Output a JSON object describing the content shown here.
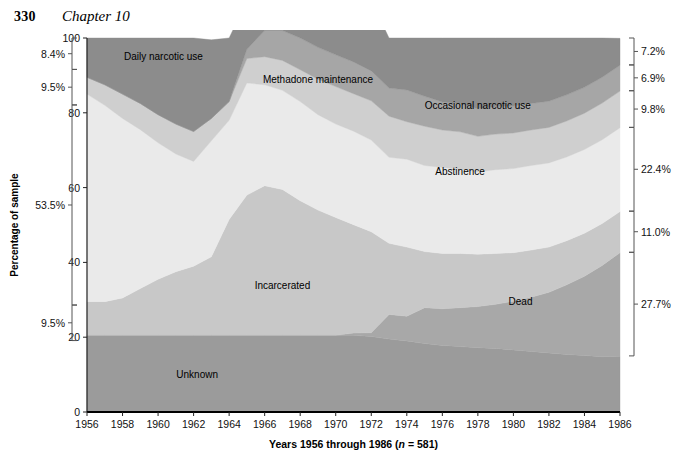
{
  "running_head": {
    "page_number": "330",
    "chapter": "Chapter 10"
  },
  "axes": {
    "y_title": "Percentage of sample",
    "y_ticks": [
      "0",
      "20",
      "40",
      "60",
      "80",
      "100"
    ],
    "y_tick_values": [
      0,
      20,
      40,
      60,
      80,
      100
    ],
    "x_title_main": "Years 1956 through 1986 (",
    "x_title_italic": "n",
    "x_title_tail": " = 581)",
    "x_title_full": "Years 1956 through 1986 (n = 581)",
    "x_ticks": [
      "1956",
      "1958",
      "1960",
      "1962",
      "1964",
      "1966",
      "1968",
      "1970",
      "1972",
      "1974",
      "1976",
      "1978",
      "1980",
      "1982",
      "1984",
      "1986"
    ],
    "left_percent_labels": [
      {
        "text": "8.4%",
        "from": 91.6,
        "to": 100.0
      },
      {
        "text": "9.5%",
        "from": 82.1,
        "to": 91.6
      },
      {
        "text": "53.5%",
        "from": 28.6,
        "to": 82.1
      },
      {
        "text": "9.5%",
        "from": 19.1,
        "to": 28.6
      }
    ],
    "right_percent_labels": [
      {
        "text": "7.2%",
        "from": 92.8,
        "to": 100.0
      },
      {
        "text": "6.9%",
        "from": 85.9,
        "to": 92.8
      },
      {
        "text": "9.8%",
        "from": 76.1,
        "to": 85.9
      },
      {
        "text": "22.4%",
        "from": 53.7,
        "to": 76.1
      },
      {
        "text": "11.0%",
        "from": 42.7,
        "to": 53.7
      },
      {
        "text": "27.7%",
        "from": 15.0,
        "to": 42.7
      }
    ]
  },
  "chart_data": {
    "type": "area",
    "title": "",
    "subtitle": "",
    "xlabel": "Years 1956 through 1986 (n = 581)",
    "ylabel": "Percentage of sample",
    "ylim": [
      0,
      100
    ],
    "xlim": [
      1956,
      1986
    ],
    "grid": false,
    "legend": "in-plot labels",
    "stacked": true,
    "x": [
      1956,
      1957,
      1958,
      1959,
      1960,
      1961,
      1962,
      1963,
      1964,
      1965,
      1966,
      1967,
      1968,
      1969,
      1970,
      1971,
      1972,
      1973,
      1974,
      1975,
      1976,
      1977,
      1978,
      1979,
      1980,
      1981,
      1982,
      1983,
      1984,
      1985,
      1986
    ],
    "series": [
      {
        "name": "Unknown",
        "color": "#9b9b9b",
        "label_x": 1962.2,
        "label_y": 9.0,
        "values": [
          20.5,
          20.5,
          20.5,
          20.5,
          20.5,
          20.5,
          20.5,
          20.5,
          20.5,
          20.5,
          20.5,
          20.5,
          20.5,
          20.5,
          20.5,
          20.5,
          20.2,
          19.5,
          19.0,
          18.3,
          17.8,
          17.5,
          17.2,
          17.0,
          16.6,
          16.2,
          15.8,
          15.4,
          15.1,
          14.8,
          14.9
        ]
      },
      {
        "name": "Dead",
        "color": "#a8a8a8",
        "label_x": 1980.4,
        "label_y": 28.5,
        "values": [
          0,
          0,
          0,
          0,
          0,
          0,
          0,
          0,
          0,
          0,
          0,
          0,
          0,
          0,
          0,
          0.6,
          1.0,
          6.6,
          6.6,
          9.6,
          9.8,
          10.4,
          11.0,
          11.8,
          13.0,
          14.5,
          16.2,
          18.6,
          21.2,
          24.4,
          27.7
        ]
      },
      {
        "name": "Incarcerated",
        "color": "#c8c8c8",
        "label_x": 1967.0,
        "label_y": 33.0,
        "values": [
          9.0,
          9.0,
          10.0,
          12.5,
          15.0,
          17.0,
          18.5,
          21.0,
          31.0,
          37.5,
          40.0,
          39.0,
          36.0,
          33.5,
          31.5,
          29.0,
          27.0,
          19.0,
          18.5,
          15.0,
          14.8,
          14.5,
          14.0,
          13.6,
          13.0,
          12.6,
          12.1,
          11.8,
          11.5,
          11.2,
          11.0
        ]
      },
      {
        "name": "Abstinence",
        "color": "#eaeaea",
        "label_x": 1977.0,
        "label_y": 63.5,
        "values": [
          55.5,
          52.5,
          48.0,
          42.5,
          36.5,
          31.5,
          28.0,
          31.0,
          26.5,
          30.0,
          27.0,
          26.5,
          26.5,
          25.5,
          25.0,
          25.0,
          24.5,
          23.0,
          23.5,
          23.0,
          23.0,
          22.5,
          22.0,
          22.4,
          22.5,
          22.6,
          22.5,
          22.4,
          22.4,
          22.4,
          22.4
        ]
      },
      {
        "name": "Occasional narcotic use",
        "color": "#cfcfcf",
        "label_x": 1978.0,
        "label_y": 81.0,
        "values": [
          4.5,
          5.5,
          6.5,
          7.0,
          7.5,
          8.0,
          8.0,
          6.0,
          5.0,
          6.5,
          7.5,
          8.0,
          8.5,
          9.5,
          10.0,
          10.0,
          10.5,
          11.0,
          10.0,
          10.5,
          10.0,
          10.0,
          9.5,
          9.5,
          9.5,
          9.5,
          9.5,
          9.6,
          9.7,
          9.8,
          9.8
        ]
      },
      {
        "name": "Methadone maintenance",
        "color": "#a6a6a6",
        "label_x": 1969.0,
        "label_y": 88.0,
        "values": [
          0,
          0,
          0,
          0,
          0,
          0,
          0,
          0,
          0,
          2.5,
          7.0,
          8.0,
          8.5,
          8.5,
          8.5,
          8.5,
          8.0,
          7.5,
          8.5,
          8.0,
          7.5,
          7.5,
          7.4,
          7.3,
          7.2,
          7.1,
          7.0,
          7.0,
          6.9,
          6.9,
          6.9
        ]
      },
      {
        "name": "Daily narcotic use",
        "color": "#8c8c8c",
        "label_x": 1960.3,
        "label_y": 94.0,
        "values": [
          10.5,
          12.5,
          15.0,
          17.5,
          20.5,
          23.0,
          25.0,
          21.0,
          17.0,
          13.0,
          11.5,
          11.5,
          12.0,
          13.5,
          14.5,
          16.4,
          18.8,
          13.4,
          13.9,
          15.6,
          17.1,
          17.6,
          18.9,
          18.4,
          18.2,
          17.5,
          16.9,
          15.2,
          13.2,
          10.5,
          7.2
        ]
      }
    ]
  }
}
